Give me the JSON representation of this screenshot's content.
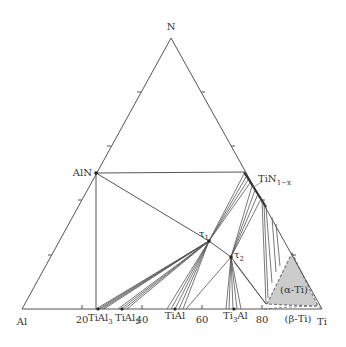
{
  "diagram": {
    "type": "ternary-phase-diagram",
    "vertices": {
      "top": "N",
      "left": "Al",
      "right": "Ti"
    },
    "axis_ticks": [
      "20",
      "40",
      "60",
      "80"
    ],
    "phases": {
      "AlN": "AlN",
      "TiN_base": "TiN",
      "TiN_sub": "1−x",
      "tau1_base": "τ",
      "tau1_sub": "1",
      "tau2_base": "τ",
      "tau2_sub": "2",
      "TiAl3_base": "TiAl",
      "TiAl3_sub": "3",
      "TiAl2_base": "TiAl",
      "TiAl2_sub": "2",
      "TiAl": "TiAl",
      "Ti3Al_pre": "Ti",
      "Ti3Al_sub": "3",
      "Ti3Al_post": "Al",
      "alpha_Ti": "(α-Ti)",
      "beta_Ti": "(β-Ti)"
    },
    "colors": {
      "line": "#444444",
      "alpha_fill": "#cccccc",
      "dashed": "#777777"
    }
  }
}
